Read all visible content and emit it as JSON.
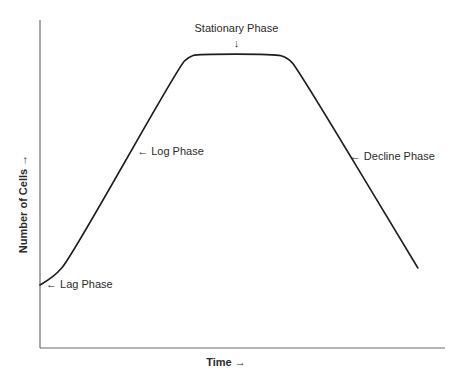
{
  "chart_data": {
    "type": "line",
    "title": "",
    "xlabel": "Time →",
    "ylabel": "Number of Cells →",
    "xlim": [
      0,
      100
    ],
    "ylim": [
      0,
      100
    ],
    "grid": false,
    "legend": "none",
    "ticks": {
      "x": [],
      "y": []
    },
    "series": [
      {
        "name": "Bacterial growth curve",
        "color": "#1e1e1e",
        "points": [
          {
            "x": 0.0,
            "y": 19.2
          },
          {
            "x": 3.5,
            "y": 21.6
          },
          {
            "x": 7.4,
            "y": 27.4
          },
          {
            "x": 34.6,
            "y": 86.3
          },
          {
            "x": 36.8,
            "y": 88.8
          },
          {
            "x": 38.8,
            "y": 89.6
          },
          {
            "x": 58.0,
            "y": 89.6
          },
          {
            "x": 61.0,
            "y": 88.6
          },
          {
            "x": 63.5,
            "y": 85.4
          },
          {
            "x": 93.3,
            "y": 24.4
          }
        ]
      }
    ],
    "annotations": [
      {
        "id": "lag",
        "text": "← Lag Phase",
        "at": {
          "x": 0.5,
          "y": 19.5
        },
        "arrow": "left"
      },
      {
        "id": "log",
        "text": "← Log Phase",
        "at": {
          "x": 23.0,
          "y": 60.0
        },
        "arrow": "left"
      },
      {
        "id": "stationary",
        "text": "Stationary Phase",
        "at": {
          "x": 48.5,
          "y": 89.6
        },
        "arrow": "down"
      },
      {
        "id": "decline",
        "text": "← Decline Phase",
        "at": {
          "x": 75.5,
          "y": 58.5
        },
        "arrow": "left"
      }
    ]
  }
}
